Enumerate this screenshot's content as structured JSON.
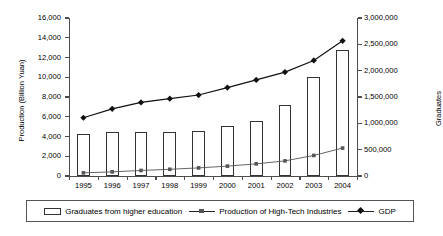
{
  "chart_data": {
    "type": "bar",
    "title": "",
    "xlabel": "",
    "ylabel": "Production (Billion Yuan)",
    "ylabel_right": "Graduates",
    "categories": [
      "1995",
      "1996",
      "1997",
      "1998",
      "1999",
      "2000",
      "2001",
      "2002",
      "2003",
      "2004"
    ],
    "ylim": [
      0,
      16000
    ],
    "yticks": [
      "0",
      "2,000",
      "4,000",
      "6,000",
      "8,000",
      "10,000",
      "12,000",
      "14,000",
      "16,000"
    ],
    "ylim_right": [
      0,
      3000000
    ],
    "yticks_right": [
      "0",
      "500,000",
      "1,000,000",
      "1,500,000",
      "2,000,000",
      "2,500,000",
      "3,000,000"
    ],
    "grid": false,
    "legend_position": "bottom",
    "series": [
      {
        "name": "Graduates from higher education",
        "type": "bar",
        "axis": "right",
        "values": [
          805000,
          840000,
          830000,
          830000,
          850000,
          950000,
          1035000,
          1340000,
          1880000,
          2390000
        ]
      },
      {
        "name": "Production of High-Tech Industries",
        "type": "line",
        "axis": "left",
        "marker": "square",
        "values": [
          320,
          420,
          560,
          680,
          820,
          1000,
          1230,
          1530,
          2080,
          2830
        ]
      },
      {
        "name": "GDP",
        "type": "line",
        "axis": "left",
        "marker": "diamond",
        "values": [
          5900,
          6800,
          7450,
          7830,
          8200,
          8950,
          9730,
          10520,
          11700,
          13690
        ]
      }
    ]
  },
  "legend": {
    "items": [
      {
        "label": "Graduates from higher education",
        "marker": "bar-swatch"
      },
      {
        "label": "Production of High-Tech Industries",
        "marker": "square-line"
      },
      {
        "label": "GDP",
        "marker": "diamond-line"
      }
    ]
  },
  "colors": {
    "bar_edge": "#333333",
    "bar_fill": "#ffffff",
    "gdp_line": "#111111",
    "production_line": "#555555",
    "axis": "#4d4d4d",
    "background": "#ffffff"
  }
}
